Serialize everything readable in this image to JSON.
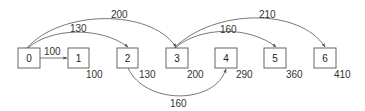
{
  "diagram": {
    "type": "shortest-path-graph",
    "nodes": [
      {
        "id": "0",
        "label": "0",
        "x": 18,
        "distance": ""
      },
      {
        "id": "1",
        "label": "1",
        "x": 68,
        "distance": "100"
      },
      {
        "id": "2",
        "label": "2",
        "x": 117,
        "distance": "130"
      },
      {
        "id": "3",
        "label": "3",
        "x": 166,
        "distance": "200"
      },
      {
        "id": "4",
        "label": "4",
        "x": 215,
        "distance": "290"
      },
      {
        "id": "5",
        "label": "5",
        "x": 264,
        "distance": "360"
      },
      {
        "id": "6",
        "label": "6",
        "x": 314,
        "distance": "410"
      }
    ],
    "edges": [
      {
        "from": "0",
        "to": "1",
        "weight": "100",
        "style": "straight"
      },
      {
        "from": "0",
        "to": "2",
        "weight": "130",
        "style": "arc-above"
      },
      {
        "from": "0",
        "to": "3",
        "weight": "200",
        "style": "arc-above"
      },
      {
        "from": "2",
        "to": "4",
        "weight": "160",
        "style": "arc-below"
      },
      {
        "from": "3",
        "to": "5",
        "weight": "160",
        "style": "arc-above"
      },
      {
        "from": "3",
        "to": "6",
        "weight": "210",
        "style": "arc-above"
      }
    ],
    "colors": {
      "stroke": "#555555",
      "text": "#333333",
      "background": "#ffffff"
    }
  }
}
